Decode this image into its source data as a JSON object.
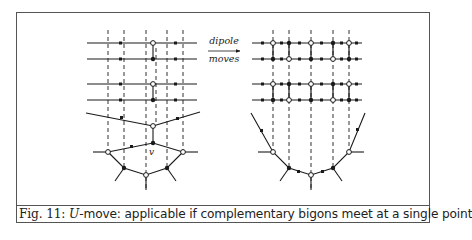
{
  "figure": {
    "number_label": "Fig. 11:",
    "caption_math": "U",
    "caption_rest": "-move: applicable if complementary bigons meet at a single point",
    "arrow": {
      "top_label": "dipole",
      "bottom_label": "moves"
    },
    "left_diagram": {
      "vertical_dashed_x": [
        108,
        124,
        146,
        167,
        183
      ],
      "horizontal_rows_y": [
        43,
        59,
        84,
        100
      ],
      "special_vertex_label": "v"
    },
    "right_diagram": {
      "vertical_dashed_x": [
        273,
        289,
        311,
        333,
        349
      ],
      "horizontal_rows_y": [
        43,
        59,
        84,
        100
      ]
    },
    "colors": {
      "line": "#1a1a1a",
      "dash": "#333333",
      "frame": "#555555"
    }
  }
}
